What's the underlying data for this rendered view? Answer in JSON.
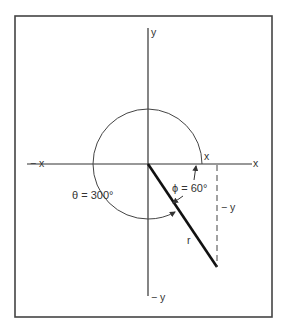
{
  "diagram": {
    "type": "polar-coordinate-angle",
    "axes": {
      "x_positive": "x",
      "x_negative": "− x",
      "y_positive": "y",
      "y_negative": "− y"
    },
    "labels": {
      "theta": "θ = 300°",
      "phi": "ϕ = 60°",
      "x_component": "x",
      "y_component": "− y",
      "radius": "r"
    },
    "angles": {
      "theta_deg": 300,
      "phi_deg": 60
    },
    "colors": {
      "line": "#333333",
      "frame": "#444444",
      "background": "#ffffff"
    }
  }
}
